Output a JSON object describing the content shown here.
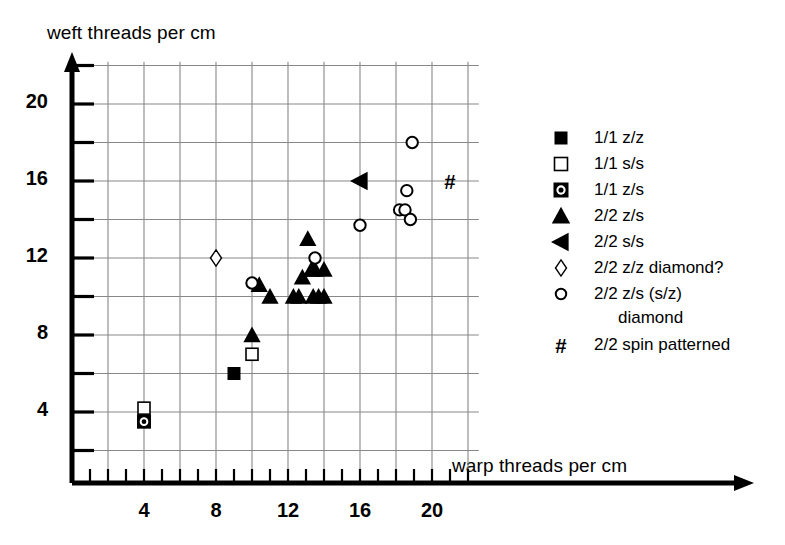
{
  "chart_data": {
    "type": "scatter",
    "title": "",
    "xlabel": "warp threads per cm",
    "ylabel": "weft threads per cm",
    "xlim": [
      0.5,
      22.6
    ],
    "ylim": [
      0.8,
      22.2
    ],
    "xticks_major": [
      4,
      8,
      12,
      16,
      20
    ],
    "xticks_major_labels": [
      "4",
      "8",
      "12",
      "16",
      "20"
    ],
    "yticks_major": [
      4,
      8,
      12,
      16,
      20
    ],
    "yticks_major_labels": [
      "4",
      "8",
      "12",
      "16",
      "20"
    ],
    "xtick_step_minor": 1,
    "ygrid_step": 2,
    "xgrid_step": 2,
    "grid": true,
    "legend_position": "right",
    "series": [
      {
        "name": "1/1 z/z",
        "marker": "filled-square",
        "points": [
          [
            4,
            3.5
          ],
          [
            9,
            6.0
          ]
        ]
      },
      {
        "name": "1/1 s/s",
        "marker": "open-square",
        "points": [
          [
            4,
            4.2
          ],
          [
            10,
            7.0
          ]
        ]
      },
      {
        "name": "1/1 z/s",
        "marker": "dotted-square",
        "points": [
          [
            4,
            3.5
          ]
        ]
      },
      {
        "name": "2/2 z/s",
        "marker": "filled-triangle-up",
        "points": [
          [
            10.0,
            8.0
          ],
          [
            10.4,
            10.6
          ],
          [
            11.0,
            10.0
          ],
          [
            12.3,
            10.0
          ],
          [
            12.6,
            10.0
          ],
          [
            12.8,
            11.0
          ],
          [
            13.1,
            13.0
          ],
          [
            13.3,
            11.4
          ],
          [
            13.5,
            11.4
          ],
          [
            13.4,
            10.0
          ],
          [
            13.7,
            10.0
          ],
          [
            14.0,
            11.4
          ],
          [
            14.0,
            10.0
          ]
        ]
      },
      {
        "name": "2/2 s/s",
        "marker": "filled-triangle-left",
        "points": [
          [
            16.0,
            16.0
          ]
        ]
      },
      {
        "name": "2/2 z/z diamond?",
        "marker": "open-diamond",
        "points": [
          [
            8.0,
            12.0
          ]
        ]
      },
      {
        "name": "2/2 z/s (s/z) diamond",
        "marker": "open-circle",
        "points": [
          [
            10.0,
            10.7
          ],
          [
            13.5,
            12.0
          ],
          [
            16.0,
            13.7
          ],
          [
            18.2,
            14.5
          ],
          [
            18.5,
            14.5
          ],
          [
            18.8,
            14.0
          ],
          [
            18.6,
            15.5
          ],
          [
            18.9,
            18.0
          ]
        ]
      },
      {
        "name": "2/2 spin patterned",
        "marker": "hash",
        "points": [
          [
            21.0,
            16.0
          ]
        ]
      }
    ]
  },
  "legend": {
    "items": [
      {
        "symbol": "filled-square-icon",
        "label": "1/1 z/z"
      },
      {
        "symbol": "open-square-icon",
        "label": "1/1 s/s"
      },
      {
        "symbol": "dotted-square-icon",
        "label": "1/1 z/s"
      },
      {
        "symbol": "filled-triangle-up-icon",
        "label": "2/2 z/s"
      },
      {
        "symbol": "filled-triangle-left-icon",
        "label": "2/2 s/s"
      },
      {
        "symbol": "open-diamond-icon",
        "label": "2/2 z/z diamond?"
      },
      {
        "symbol": "open-circle-icon",
        "label": "2/2 z/s (s/z)"
      },
      {
        "symbol": "hash-icon",
        "label": "2/2 spin patterned"
      }
    ],
    "continuation_line": "diamond"
  },
  "colors": {
    "marker": "#000000",
    "axis": "#000000",
    "grid": "#888888",
    "background": "#ffffff"
  }
}
